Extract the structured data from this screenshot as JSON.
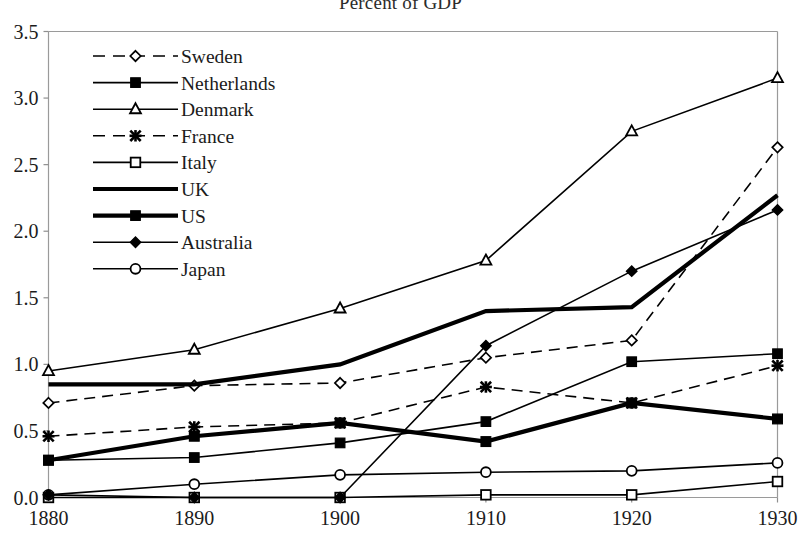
{
  "chart_data": {
    "type": "line",
    "title": "Percent of GDP",
    "xlabel": "",
    "ylabel": "",
    "x": [
      1880,
      1890,
      1900,
      1910,
      1920,
      1930
    ],
    "categories": [
      "1880",
      "1890",
      "1900",
      "1910",
      "1920",
      "1930"
    ],
    "xtick_labels": [
      "1880",
      "1890",
      "1900",
      "1910",
      "1920",
      "1930"
    ],
    "ytick_labels": [
      "0.0",
      "0.5",
      "1.0",
      "1.5",
      "2.0",
      "2.5",
      "3.0",
      "3.5"
    ],
    "ylim": [
      0.0,
      3.5
    ],
    "xlim": [
      1880,
      1930
    ],
    "grid": false,
    "legend_position": "upper-left-inside",
    "series": [
      {
        "name": "Sweden",
        "values": [
          0.71,
          0.84,
          0.86,
          1.05,
          1.18,
          2.63
        ],
        "marker": "open-diamond",
        "dash": "dashed",
        "width": 1.6
      },
      {
        "name": "Netherlands",
        "values": [
          0.28,
          0.3,
          0.41,
          0.57,
          1.02,
          1.08
        ],
        "marker": "filled-square",
        "dash": "solid",
        "width": 1.6
      },
      {
        "name": "Denmark",
        "values": [
          0.95,
          1.11,
          1.42,
          1.78,
          2.75,
          3.15
        ],
        "marker": "open-triangle",
        "dash": "solid",
        "width": 1.6
      },
      {
        "name": "France",
        "values": [
          0.46,
          0.53,
          0.56,
          0.83,
          0.71,
          0.99
        ],
        "marker": "star-x",
        "dash": "dashed",
        "width": 1.6
      },
      {
        "name": "Italy",
        "values": [
          0.0,
          0.0,
          0.0,
          0.02,
          0.02,
          0.12
        ],
        "marker": "open-square",
        "dash": "solid",
        "width": 1.6
      },
      {
        "name": "UK",
        "values": [
          0.85,
          0.85,
          1.0,
          1.4,
          1.43,
          2.27
        ],
        "marker": "none",
        "dash": "solid",
        "width": 4.2
      },
      {
        "name": "US",
        "values": [
          0.28,
          0.46,
          0.56,
          0.42,
          0.71,
          0.59
        ],
        "marker": "filled-square",
        "dash": "solid",
        "width": 4.2
      },
      {
        "name": "Australia",
        "values": [
          0.02,
          0.0,
          0.0,
          1.14,
          1.7,
          2.16
        ],
        "marker": "filled-diamond",
        "dash": "solid",
        "width": 1.6
      },
      {
        "name": "Japan",
        "values": [
          0.02,
          0.1,
          0.17,
          0.19,
          0.2,
          0.26
        ],
        "marker": "open-circle",
        "dash": "solid",
        "width": 1.6
      }
    ],
    "legend_entries": [
      "Sweden",
      "Netherlands",
      "Denmark",
      "France",
      "Italy",
      "UK",
      "US",
      "Australia",
      "Japan"
    ]
  },
  "colors": {
    "line": "#000000",
    "axis": "#9a9a9a",
    "text": "#1b1b1b",
    "background": "#ffffff"
  }
}
